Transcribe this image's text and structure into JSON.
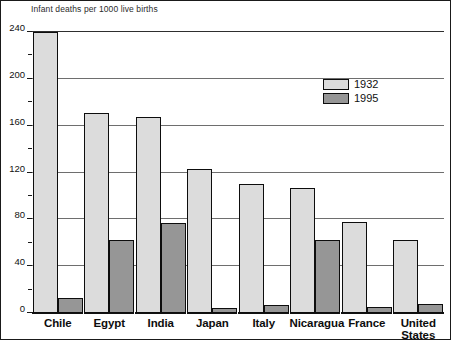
{
  "chart_data": {
    "type": "bar",
    "title": "Infant deaths per 1000 live births",
    "xlabel": "",
    "ylabel": "Infant deaths per 1000 live births",
    "ylim": [
      0,
      240
    ],
    "yticks": [
      0,
      40,
      80,
      120,
      160,
      200,
      240
    ],
    "ytick_labels": [
      "0",
      "40",
      "80",
      "120",
      "160",
      "200",
      "240"
    ],
    "minor_tick_step": 20,
    "grid": "horizontal",
    "legend_position": "upper-right-inside",
    "categories": [
      "Chile",
      "Egypt",
      "India",
      "Japan",
      "Italy",
      "Nicaragua",
      "France",
      "United States"
    ],
    "series": [
      {
        "name": "1932",
        "color": "#dcdcdc",
        "values": [
          240,
          171,
          167,
          123,
          110,
          107,
          78,
          62
        ]
      },
      {
        "name": "1995",
        "color": "#969696",
        "values": [
          13,
          62,
          77,
          4,
          7,
          62,
          5,
          8
        ]
      }
    ]
  },
  "legend": {
    "items": [
      {
        "label": "1932",
        "swatch": "y1932"
      },
      {
        "label": "1995",
        "swatch": "y1995"
      }
    ]
  },
  "colors": {
    "series_1932": "#dcdcdc",
    "series_1995": "#969696",
    "outline": "#0d0d0d",
    "gridline": "#6e6e6e",
    "background": "#ffffff"
  }
}
